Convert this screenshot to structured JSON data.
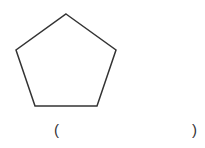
{
  "figure": {
    "shape": "pentagon",
    "stroke_color": "#333333",
    "fill_color": "#ffffff"
  },
  "answer_blank": {
    "open": "(",
    "close": ")",
    "value": ""
  }
}
